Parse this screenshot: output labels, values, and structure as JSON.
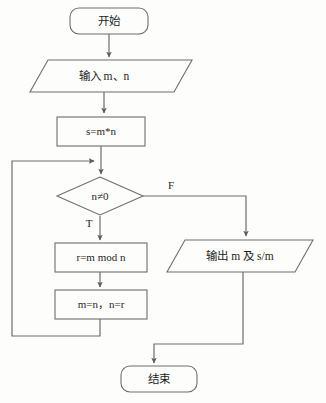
{
  "diagram": {
    "type": "flowchart",
    "colors": {
      "background": "#fdfdfb",
      "stroke": "#6e6e6e",
      "text": "#1f1f1f"
    },
    "nodes": [
      {
        "id": "start",
        "shape": "terminator",
        "label": "开始",
        "x": 109,
        "y": 21,
        "width": 78,
        "height": 26
      },
      {
        "id": "input",
        "shape": "parallelogram",
        "label": "输入 m、n",
        "x": 102,
        "y": 76,
        "width": 144,
        "height": 32
      },
      {
        "id": "assign-s",
        "shape": "rectangle",
        "label": "s=m*n",
        "x": 101,
        "y": 131,
        "width": 88,
        "height": 29
      },
      {
        "id": "condition",
        "shape": "diamond",
        "label": "n≠0",
        "x": 100,
        "y": 196,
        "width": 86,
        "height": 39
      },
      {
        "id": "mod",
        "shape": "rectangle",
        "label": "r=m mod n",
        "x": 101,
        "y": 257,
        "width": 92,
        "height": 29
      },
      {
        "id": "swap",
        "shape": "rectangle",
        "label": "m=n，n=r",
        "x": 101,
        "y": 304,
        "width": 92,
        "height": 29
      },
      {
        "id": "output",
        "shape": "parallelogram",
        "label": "输出 m 及 s/m",
        "x": 240,
        "y": 256,
        "width": 146,
        "height": 32
      },
      {
        "id": "end",
        "shape": "terminator",
        "label": "结束",
        "x": 159,
        "y": 379,
        "width": 76,
        "height": 26
      }
    ],
    "branch_labels": [
      {
        "id": "false-label",
        "text": "F",
        "x": 171,
        "y": 186
      },
      {
        "id": "true-label",
        "text": "T",
        "x": 89,
        "y": 224
      }
    ],
    "edges": [
      {
        "id": "start-to-input",
        "from": "start",
        "to": "input",
        "label": ""
      },
      {
        "id": "input-to-assign",
        "from": "input",
        "to": "assign-s",
        "label": ""
      },
      {
        "id": "assign-to-condition",
        "from": "assign-s",
        "to": "condition",
        "label": ""
      },
      {
        "id": "condition-true-to-mod",
        "from": "condition",
        "to": "mod",
        "label": "T"
      },
      {
        "id": "condition-false-to-output",
        "from": "condition",
        "to": "output",
        "label": "F"
      },
      {
        "id": "mod-to-swap",
        "from": "mod",
        "to": "swap",
        "label": ""
      },
      {
        "id": "swap-loop-back",
        "from": "swap",
        "to": "condition",
        "label": ""
      },
      {
        "id": "output-to-end",
        "from": "output",
        "to": "end",
        "label": ""
      }
    ]
  }
}
